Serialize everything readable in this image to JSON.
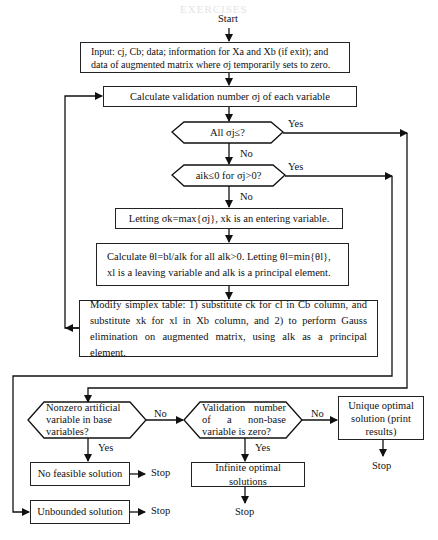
{
  "header": {
    "faint_title": "EXERCISES"
  },
  "start_label": "Start",
  "steps": {
    "input": "Input: cj, Cb; data; information for Xa and Xb (if exit); and data of augmented matrix where σj temporarily sets to zero.",
    "calc_validation": "Calculate validation number σj of each variable",
    "decision_all_sigma": "All σj≤?",
    "decision_aik": "aik≤0 for σj>0?",
    "letting_sigma": "Letting σk=max{σj}, xk is an entering variable.",
    "calc_theta": "Calculate θl=bl/alk for all alk>0. Letting θl=min{θl}, xl is a leaving variable and alk is a principal element.",
    "modify_table": "Modify simplex table: 1) substitute ck for cl in Cb column, and substitute xk for xl in Xb column, and 2) to perform Gauss elimination on augmented matrix, using alk as a principal element.",
    "decision_artificial": "Nonzero artificial variable in base variables?",
    "decision_nonbase": "Validation number of a non-base variable is zero?",
    "unique_optimal": "Unique optimal solution (print results)",
    "no_feasible": "No feasible solution",
    "infinite_optimal": "Infinite optimal solutions",
    "unbounded": "Unbounded solution"
  },
  "edge_labels": {
    "yes": "Yes",
    "no": "No",
    "stop": "Stop"
  }
}
